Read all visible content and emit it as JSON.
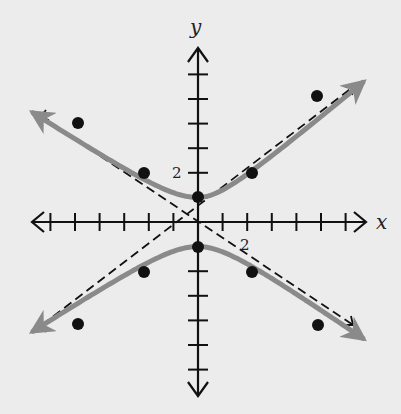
{
  "chart_data": {
    "type": "line",
    "title": "",
    "xlabel": "x",
    "ylabel": "y",
    "xlim": [
      -7,
      7
    ],
    "ylim": [
      -7.5,
      8.2
    ],
    "grid": false,
    "x_tick_step": 1,
    "y_tick_step": 1,
    "tick_labels": [
      {
        "axis": "x",
        "value": 2,
        "text": "2"
      },
      {
        "axis": "y",
        "value": 2,
        "text": "2"
      }
    ],
    "series": [
      {
        "name": "hyperbola (upper branch)",
        "style": "solid-gray",
        "equation": "y^2 - x^2/1.78 = 1",
        "points": [
          [
            -6.5,
            5.0
          ],
          [
            -4.9,
            4.0
          ],
          [
            -2.2,
            2.0
          ],
          [
            0,
            1
          ],
          [
            2.2,
            2.0
          ],
          [
            4.9,
            5.1
          ],
          [
            6.5,
            5.0
          ]
        ]
      },
      {
        "name": "hyperbola (lower branch)",
        "style": "solid-gray",
        "points": [
          [
            -6.5,
            -5.0
          ],
          [
            -4.9,
            -4.2
          ],
          [
            -2.2,
            -2.0
          ],
          [
            0,
            -1
          ],
          [
            2.2,
            -2.0
          ],
          [
            4.9,
            -4.2
          ],
          [
            6.5,
            -5.0
          ]
        ]
      },
      {
        "name": "asymptote y = 0.75x",
        "style": "dashed-black",
        "slope": 0.75
      },
      {
        "name": "asymptote y = -0.75x",
        "style": "dashed-black",
        "slope": -0.75
      }
    ],
    "plotted_points": [
      [
        0,
        1
      ],
      [
        0,
        -1
      ],
      [
        -2.2,
        2.0
      ],
      [
        2.2,
        2.0
      ],
      [
        -2.2,
        -2.0
      ],
      [
        2.2,
        -2.0
      ],
      [
        -4.9,
        4.0
      ],
      [
        4.9,
        5.1
      ],
      [
        -4.9,
        -4.2
      ],
      [
        4.9,
        -4.2
      ]
    ]
  },
  "labels": {
    "x_axis": "x",
    "y_axis": "y",
    "x_tick_2": "2",
    "y_tick_2": "2"
  },
  "colors": {
    "background": "#ececec",
    "curve": "#8a8a8a",
    "axes": "#111111",
    "asymptote": "#111111",
    "point": "#111111"
  }
}
